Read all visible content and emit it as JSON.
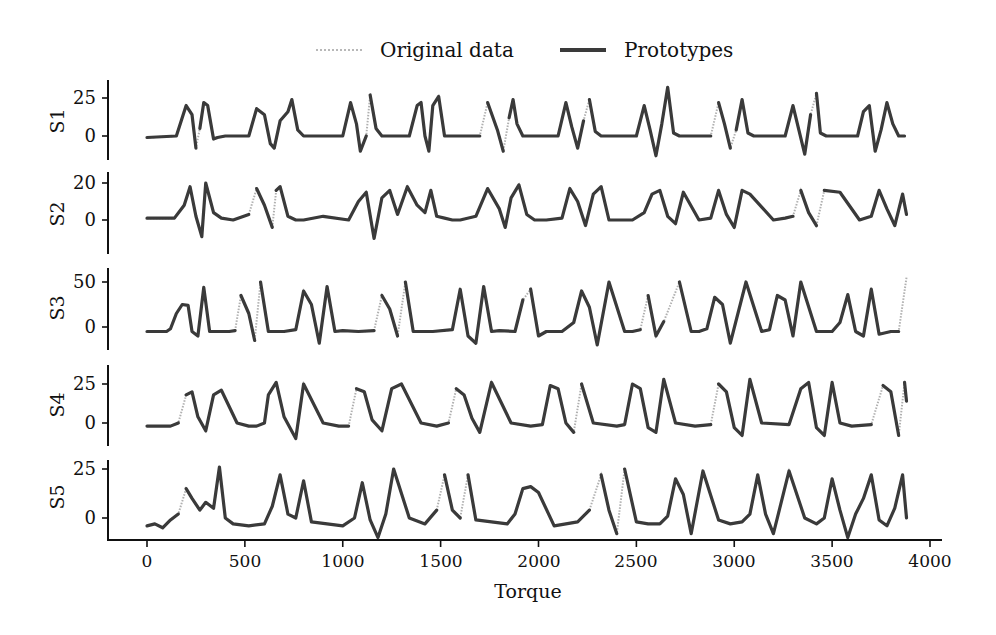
{
  "legend": {
    "original_label": "Original data",
    "prototypes_label": "Prototypes"
  },
  "xaxis": {
    "label": "Torque",
    "ticks": [
      "0",
      "500",
      "1000",
      "1500",
      "2000",
      "2500",
      "3000",
      "3500",
      "4000"
    ]
  },
  "panels": [
    {
      "label": "S1",
      "ticks": [
        "25",
        "0"
      ]
    },
    {
      "label": "S2",
      "ticks": [
        "20",
        "0"
      ]
    },
    {
      "label": "S3",
      "ticks": [
        "50",
        "0"
      ]
    },
    {
      "label": "S4",
      "ticks": [
        "25",
        "0"
      ]
    },
    {
      "label": "S5",
      "ticks": [
        "25",
        "0"
      ]
    }
  ],
  "colors": {
    "prototype": "#3a3a3a",
    "original": "#b0b0b0",
    "axis": "#111111"
  },
  "chart_data": {
    "type": "line",
    "title": "",
    "xlabel": "Torque",
    "xlim": [
      -200,
      4080
    ],
    "xticks": [
      0,
      500,
      1000,
      1500,
      2000,
      2500,
      3000,
      3500,
      4000
    ],
    "legend": [
      "Original data",
      "Prototypes"
    ],
    "legend_position": "top-center",
    "grid": false,
    "subplots": [
      {
        "name": "S1",
        "ylim": [
          -12,
          38
        ],
        "yticks": [
          0,
          25
        ],
        "x": [
          0,
          150,
          175,
          200,
          230,
          250,
          270,
          290,
          310,
          340,
          360,
          400,
          520,
          560,
          600,
          630,
          650,
          680,
          720,
          740,
          770,
          800,
          1000,
          1040,
          1070,
          1090,
          1120,
          1140,
          1170,
          1200,
          1340,
          1380,
          1400,
          1420,
          1440,
          1460,
          1490,
          1520,
          1700,
          1740,
          1790,
          1820,
          1850,
          1870,
          1890,
          1920,
          2100,
          2140,
          2170,
          2200,
          2230,
          2260,
          2290,
          2320,
          2500,
          2540,
          2570,
          2600,
          2630,
          2660,
          2690,
          2720,
          2880,
          2920,
          2950,
          2980,
          3010,
          3040,
          3070,
          3100,
          3260,
          3300,
          3330,
          3360,
          3390,
          3420,
          3440,
          3470,
          3630,
          3660,
          3690,
          3720,
          3750,
          3780,
          3810,
          3840,
          3870
        ],
        "values": [
          -1,
          0,
          10,
          20,
          14,
          -8,
          5,
          22,
          20,
          -2,
          -1,
          0,
          0,
          18,
          14,
          -5,
          -8,
          10,
          16,
          24,
          4,
          0,
          0,
          22,
          8,
          -10,
          0,
          27,
          5,
          0,
          0,
          20,
          22,
          0,
          -10,
          20,
          26,
          0,
          0,
          22,
          4,
          -10,
          12,
          24,
          8,
          0,
          0,
          22,
          6,
          -8,
          10,
          24,
          3,
          0,
          0,
          20,
          4,
          -13,
          8,
          32,
          2,
          0,
          0,
          22,
          8,
          -8,
          4,
          24,
          2,
          0,
          0,
          20,
          4,
          -12,
          14,
          28,
          2,
          0,
          0,
          16,
          20,
          -10,
          4,
          22,
          8,
          0,
          0
        ]
      },
      {
        "name": "S2",
        "ylim": [
          -12,
          24
        ],
        "yticks": [
          0,
          20
        ],
        "x": [
          0,
          140,
          190,
          220,
          250,
          280,
          300,
          340,
          380,
          440,
          520,
          560,
          600,
          640,
          660,
          680,
          720,
          760,
          800,
          900,
          1030,
          1080,
          1120,
          1160,
          1200,
          1240,
          1280,
          1330,
          1380,
          1420,
          1450,
          1480,
          1520,
          1560,
          1600,
          1680,
          1740,
          1800,
          1830,
          1860,
          1900,
          1940,
          1980,
          2040,
          2120,
          2160,
          2200,
          2240,
          2280,
          2320,
          2360,
          2480,
          2540,
          2580,
          2620,
          2660,
          2700,
          2740,
          2820,
          2880,
          2920,
          2960,
          3000,
          3040,
          3080,
          3200,
          3260,
          3300,
          3340,
          3380,
          3420,
          3460,
          3540,
          3640,
          3700,
          3740,
          3780,
          3820,
          3860,
          3880
        ],
        "values": [
          1,
          1,
          8,
          18,
          2,
          -9,
          20,
          4,
          1,
          0,
          3,
          17,
          8,
          -4,
          16,
          18,
          2,
          0,
          0,
          2,
          0,
          10,
          15,
          -10,
          12,
          16,
          3,
          18,
          8,
          4,
          16,
          2,
          1,
          0,
          0,
          2,
          17,
          6,
          -4,
          12,
          19,
          3,
          0,
          0,
          1,
          17,
          10,
          -3,
          14,
          18,
          0,
          0,
          4,
          14,
          16,
          2,
          -2,
          15,
          0,
          1,
          16,
          3,
          -4,
          16,
          14,
          0,
          1,
          2,
          16,
          4,
          -3,
          16,
          15,
          0,
          2,
          16,
          6,
          -3,
          14,
          3
        ]
      },
      {
        "name": "S3",
        "ylim": [
          -22,
          62
        ],
        "yticks": [
          0,
          50
        ],
        "x": [
          0,
          100,
          120,
          150,
          180,
          210,
          230,
          260,
          290,
          320,
          360,
          420,
          450,
          480,
          520,
          550,
          580,
          620,
          700,
          760,
          800,
          840,
          880,
          920,
          960,
          1000,
          1080,
          1160,
          1200,
          1240,
          1280,
          1320,
          1360,
          1460,
          1560,
          1600,
          1640,
          1680,
          1720,
          1760,
          1800,
          1880,
          1920,
          1960,
          2000,
          2040,
          2120,
          2180,
          2220,
          2260,
          2300,
          2360,
          2440,
          2480,
          2520,
          2560,
          2600,
          2640,
          2720,
          2780,
          2820,
          2860,
          2900,
          2940,
          2980,
          3060,
          3140,
          3180,
          3220,
          3260,
          3300,
          3340,
          3420,
          3500,
          3540,
          3580,
          3620,
          3660,
          3700,
          3740,
          3800,
          3840,
          3880
        ],
        "values": [
          -5,
          -5,
          -2,
          15,
          25,
          24,
          -5,
          -10,
          44,
          -5,
          -5,
          -5,
          -4,
          35,
          15,
          -15,
          50,
          -5,
          -5,
          -3,
          40,
          25,
          -18,
          45,
          -5,
          -4,
          -5,
          -4,
          35,
          20,
          -10,
          50,
          -5,
          -5,
          -3,
          42,
          -10,
          -18,
          45,
          -5,
          -4,
          -5,
          30,
          42,
          -10,
          -5,
          -5,
          5,
          40,
          22,
          -20,
          50,
          -5,
          -5,
          -3,
          35,
          -10,
          6,
          50,
          -5,
          -5,
          -2,
          33,
          25,
          -18,
          50,
          -5,
          -3,
          35,
          30,
          -10,
          50,
          -5,
          -5,
          5,
          36,
          -5,
          -10,
          42,
          -8,
          -5,
          -5,
          55
        ]
      },
      {
        "name": "S4",
        "ylim": [
          -12,
          36
        ],
        "yticks": [
          0,
          25
        ],
        "x": [
          0,
          120,
          160,
          200,
          230,
          260,
          300,
          340,
          380,
          460,
          520,
          560,
          600,
          620,
          660,
          700,
          760,
          800,
          900,
          980,
          1030,
          1070,
          1110,
          1150,
          1200,
          1250,
          1300,
          1400,
          1480,
          1540,
          1580,
          1620,
          1660,
          1700,
          1760,
          1860,
          1960,
          2020,
          2060,
          2100,
          2140,
          2180,
          2220,
          2280,
          2400,
          2440,
          2480,
          2520,
          2560,
          2600,
          2640,
          2700,
          2800,
          2880,
          2920,
          2960,
          3000,
          3040,
          3080,
          3140,
          3280,
          3340,
          3380,
          3420,
          3460,
          3500,
          3540,
          3600,
          3700,
          3760,
          3800,
          3840,
          3870,
          3880
        ],
        "values": [
          -2,
          -2,
          0,
          18,
          20,
          4,
          -5,
          18,
          21,
          0,
          -2,
          -2,
          0,
          18,
          26,
          4,
          -10,
          25,
          0,
          -2,
          -2,
          22,
          20,
          2,
          -5,
          22,
          25,
          0,
          -2,
          0,
          22,
          18,
          3,
          -6,
          26,
          0,
          -2,
          -1,
          24,
          22,
          0,
          -6,
          25,
          0,
          -2,
          -1,
          25,
          22,
          -3,
          -6,
          28,
          0,
          -2,
          -1,
          25,
          20,
          -3,
          -8,
          28,
          0,
          -1,
          22,
          26,
          -3,
          -8,
          26,
          0,
          -2,
          -1,
          24,
          20,
          -8,
          26,
          14
        ]
      },
      {
        "name": "S5",
        "ylim": [
          -12,
          30
        ],
        "yticks": [
          0,
          25
        ],
        "x": [
          0,
          40,
          80,
          120,
          160,
          200,
          230,
          270,
          300,
          340,
          370,
          400,
          440,
          520,
          600,
          640,
          680,
          720,
          760,
          800,
          840,
          920,
          1000,
          1060,
          1100,
          1140,
          1180,
          1220,
          1260,
          1340,
          1420,
          1480,
          1520,
          1560,
          1600,
          1640,
          1680,
          1760,
          1840,
          1880,
          1920,
          1960,
          2000,
          2080,
          2140,
          2200,
          2260,
          2320,
          2360,
          2400,
          2440,
          2500,
          2560,
          2620,
          2660,
          2700,
          2740,
          2780,
          2840,
          2920,
          2980,
          3040,
          3080,
          3120,
          3160,
          3200,
          3280,
          3360,
          3420,
          3460,
          3500,
          3540,
          3580,
          3620,
          3660,
          3700,
          3740,
          3780,
          3820,
          3860,
          3880
        ],
        "values": [
          -4,
          -3,
          -5,
          -1,
          2,
          15,
          10,
          4,
          8,
          5,
          26,
          0,
          -3,
          -4,
          -3,
          6,
          22,
          2,
          0,
          19,
          -2,
          -3,
          -4,
          0,
          18,
          -1,
          -10,
          2,
          25,
          0,
          -3,
          4,
          22,
          4,
          0,
          22,
          -1,
          -2,
          -3,
          2,
          15,
          16,
          13,
          -4,
          -3,
          -2,
          4,
          22,
          4,
          -8,
          25,
          -2,
          -3,
          -3,
          1,
          20,
          12,
          -8,
          24,
          -1,
          -3,
          -2,
          2,
          22,
          2,
          -8,
          24,
          0,
          -3,
          0,
          20,
          4,
          -10,
          2,
          10,
          22,
          -1,
          -4,
          5,
          22,
          0
        ]
      }
    ]
  }
}
